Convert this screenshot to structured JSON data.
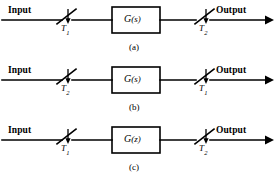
{
  "figure": {
    "name": "sampled-data-system-block-diagrams",
    "width": 278,
    "height": 180,
    "background": "#ffffff",
    "line_color": "#000000",
    "text_color": "#000000"
  },
  "common": {
    "input_label": "Input",
    "output_label": "Output",
    "sampler_icon": "sampler-switch-icon",
    "arrow_icon": "arrowhead-right-icon"
  },
  "rows": [
    {
      "id": "a",
      "caption": "(a)",
      "input_label": "Input",
      "output_label": "Output",
      "left_switch": {
        "symbol": "T",
        "subscript": "1"
      },
      "right_switch": {
        "symbol": "T",
        "subscript": "2"
      },
      "block": {
        "symbol": "G",
        "argument": "(s)",
        "full": "G(s)"
      }
    },
    {
      "id": "b",
      "caption": "(b)",
      "input_label": "Input",
      "output_label": "Output",
      "left_switch": {
        "symbol": "T",
        "subscript": "2"
      },
      "right_switch": {
        "symbol": "T",
        "subscript": "1"
      },
      "block": {
        "symbol": "G",
        "argument": "(s)",
        "full": "G(s)"
      }
    },
    {
      "id": "c",
      "caption": "(c)",
      "input_label": "Input",
      "output_label": "Output",
      "left_switch": {
        "symbol": "T",
        "subscript": "1"
      },
      "right_switch": {
        "symbol": "T",
        "subscript": "2"
      },
      "block": {
        "symbol": "G",
        "argument": "(z)",
        "full": "G(z)"
      }
    }
  ]
}
